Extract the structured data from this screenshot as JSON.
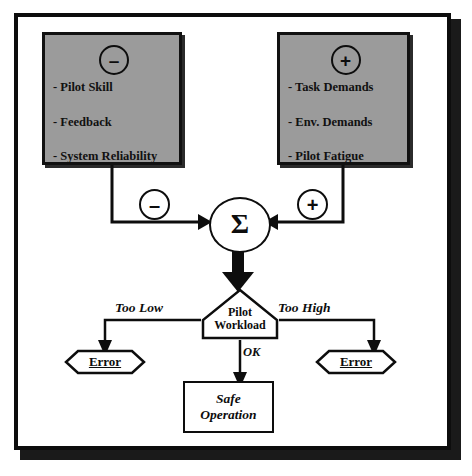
{
  "diagram": {
    "frame": {
      "border_color": "#0d0d0d",
      "background": "#ffffff"
    },
    "negative_factors_box": {
      "sign_icon": "circle-minus-icon",
      "sign": "–",
      "fill_color": "#9b9b9b",
      "items": [
        "- Pilot Skill",
        "- Feedback",
        "- System Reliability"
      ]
    },
    "positive_factors_box": {
      "sign_icon": "circle-plus-icon",
      "sign": "+",
      "fill_color": "#9b9b9b",
      "items": [
        "- Task Demands",
        "- Env. Demands",
        "- Pilot Fatigue"
      ]
    },
    "wire_signs": {
      "negative": "–",
      "positive": "+"
    },
    "summing_junction": {
      "symbol": "Σ",
      "name": "summation"
    },
    "decision_node": {
      "label_line1": "Pilot",
      "label_line2": "Workload"
    },
    "branches": {
      "left_label": "Too Low",
      "center_label": "OK",
      "right_label": "Too High"
    },
    "outcomes": {
      "error_left": "Error",
      "error_right": "Error",
      "safe_line1": "Safe",
      "safe_line2": "Operation"
    }
  }
}
